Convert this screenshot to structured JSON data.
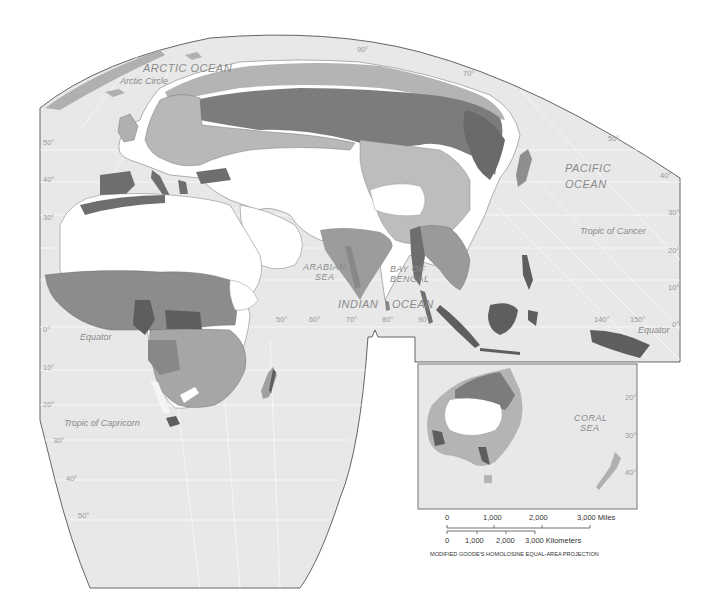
{
  "map": {
    "title": "",
    "projection_note": "MODIFIED GOODE'S HOMOLOSINE EQUAL-AREA PROJECTION",
    "colors": {
      "ocean": "#e8e8e8",
      "frame": "#555555",
      "zone_darkest": "#5e5e5e",
      "zone_dark": "#7c7c7c",
      "zone_medium": "#9c9c9c",
      "zone_light": "#bdbdbd",
      "zone_white": "#ffffff",
      "label": "#8a8a8a"
    },
    "water_labels": {
      "arctic": "ARCTIC OCEAN",
      "pacific_1": "PACIFIC",
      "pacific_2": "OCEAN",
      "arabian_1": "ARABIAN",
      "arabian_2": "SEA",
      "bengal_1": "BAY OF",
      "bengal_2": "BENGAL",
      "indian": "INDIAN",
      "indian_ocean": "OCEAN",
      "coral_1": "CORAL",
      "coral_2": "SEA"
    },
    "line_labels": {
      "arctic_circle": "Arctic Circle",
      "tropic_cancer": "Tropic of Cancer",
      "equator_west": "Equator",
      "equator_east": "Equator",
      "tropic_capricorn": "Tropic of Capricorn"
    },
    "latitude_labels_left": [
      "50°",
      "40°",
      "30°",
      "0°",
      "10°",
      "20°",
      "30°",
      "40°",
      "50°"
    ],
    "latitude_labels_right": [
      "50°",
      "40°",
      "30°",
      "20°",
      "10°",
      "0°"
    ],
    "australia_lat_labels": [
      "20°",
      "30°",
      "40°"
    ],
    "longitude_labels": [
      "50°",
      "60°",
      "70°",
      "80°",
      "90°",
      "140°",
      "150°"
    ],
    "top_labels": [
      "90°",
      "70°"
    ],
    "scale": {
      "miles": [
        "0",
        "1,000",
        "2,000",
        "3,000 Miles"
      ],
      "kilometers": [
        "0",
        "1,000",
        "2,000",
        "3,000 Kilometers"
      ]
    }
  }
}
